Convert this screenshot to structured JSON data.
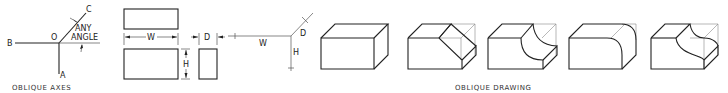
{
  "figures": {
    "axes": {
      "caption": "OBLIQUE AXES",
      "labels": {
        "a": "A",
        "b": "B",
        "c": "C",
        "o": "O",
        "any": "ANY",
        "angle": "ANGLE"
      }
    },
    "orthographic": {
      "labels": {
        "w": "W",
        "h": "H",
        "d": "D"
      }
    },
    "oblique_dims": {
      "labels": {
        "w": "W",
        "h": "H",
        "d": "D"
      }
    },
    "oblique_drawing": {
      "caption": "OBLIQUE DRAWING",
      "steps": [
        "box",
        "chamfer",
        "concave-cut",
        "rounded-edge",
        "s-curve"
      ]
    }
  },
  "colors": {
    "line": "#222222",
    "construction": "#888888",
    "background": "#ffffff"
  }
}
